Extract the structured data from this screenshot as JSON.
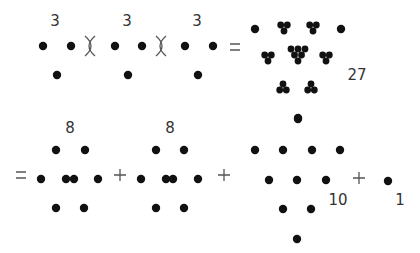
{
  "diagram": {
    "title": "",
    "dot_color": "#111111",
    "text_color": "#333333",
    "equation_top": {
      "factors": [
        {
          "label": "3",
          "label_pos": [
            55,
            26
          ],
          "dots": [
            [
              43,
              46
            ],
            [
              71,
              46
            ],
            [
              57,
              75
            ]
          ]
        },
        {
          "label": "3",
          "label_pos": [
            127,
            26
          ],
          "dots": [
            [
              115,
              46
            ],
            [
              142,
              46
            ],
            [
              128,
              75
            ]
          ]
        },
        {
          "label": "3",
          "label_pos": [
            197,
            26
          ],
          "dots": [
            [
              185,
              46
            ],
            [
              213,
              46
            ],
            [
              198,
              75
            ]
          ]
        }
      ],
      "operators": [
        {
          "symbol": "times",
          "pos": [
            90,
            46
          ]
        },
        {
          "symbol": "times",
          "pos": [
            161,
            46
          ]
        },
        {
          "symbol": "equals",
          "pos": [
            235,
            47
          ]
        }
      ],
      "result": {
        "label": "27",
        "label_pos": [
          357,
          80
        ],
        "singles": [
          [
            255,
            29
          ],
          [
            341,
            29
          ],
          [
            298,
            118
          ]
        ],
        "clusters": [
          {
            "center": [
              284,
              27
            ],
            "orient": "down"
          },
          {
            "center": [
              313,
              27
            ],
            "orient": "down"
          },
          {
            "center": [
              268,
              57
            ],
            "orient": "down"
          },
          {
            "center": [
              326,
              57
            ],
            "orient": "down"
          },
          {
            "center": [
              283,
              88
            ],
            "orient": "up"
          },
          {
            "center": [
              311,
              88
            ],
            "orient": "up"
          }
        ],
        "big_clusters": [
          {
            "center": [
              298,
              53
            ]
          }
        ]
      }
    },
    "equation_bottom": {
      "leading_operator": {
        "symbol": "equals",
        "pos": [
          21,
          175
        ]
      },
      "terms": [
        {
          "label": "8",
          "label_pos": [
            70,
            133
          ],
          "dots": [
            [
              56,
              150
            ],
            [
              85,
              150
            ],
            [
              41,
              179
            ],
            [
              66,
              179
            ],
            [
              74,
              179
            ],
            [
              98,
              179
            ],
            [
              56,
              208
            ],
            [
              84,
              208
            ]
          ]
        },
        {
          "label": "8",
          "label_pos": [
            170,
            133
          ],
          "dots": [
            [
              156,
              150
            ],
            [
              184,
              150
            ],
            [
              141,
              179
            ],
            [
              166,
              179
            ],
            [
              173,
              179
            ],
            [
              198,
              179
            ],
            [
              156,
              208
            ],
            [
              184,
              208
            ]
          ]
        },
        {
          "label": "10",
          "label_pos": [
            338,
            205
          ],
          "dots": [
            [
              298,
              119
            ],
            [
              255,
              150
            ],
            [
              283,
              150
            ],
            [
              312,
              150
            ],
            [
              340,
              150
            ],
            [
              269,
              180
            ],
            [
              297,
              180
            ],
            [
              326,
              180
            ],
            [
              283,
              209
            ],
            [
              311,
              209
            ],
            [
              297,
              239
            ]
          ]
        },
        {
          "label": "1",
          "label_pos": [
            400,
            205
          ],
          "dots": [
            [
              388,
              181
            ]
          ]
        }
      ],
      "operators": [
        {
          "symbol": "plus",
          "pos": [
            120,
            175
          ]
        },
        {
          "symbol": "plus",
          "pos": [
            224,
            175
          ]
        },
        {
          "symbol": "plus",
          "pos": [
            359,
            178
          ]
        }
      ]
    }
  }
}
